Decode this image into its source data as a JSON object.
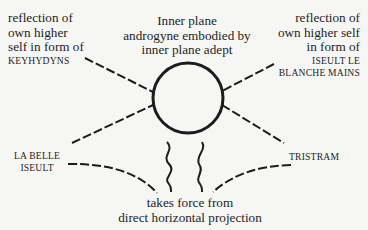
{
  "diagram": {
    "center_node": {
      "lines": [
        "Inner plane",
        "androgyne embodied by",
        "inner plane adept"
      ],
      "shape": "circle"
    },
    "top_left": {
      "lines": [
        "reflection of",
        "own higher",
        "self in form of"
      ],
      "name": "KEYHYDYNS"
    },
    "top_right": {
      "lines": [
        "reflection of",
        "own higher self",
        "in form of"
      ],
      "name_lines": [
        "ISEULT LE",
        "BLANCHE MAINS"
      ]
    },
    "bottom_left": {
      "name_lines": [
        "LA BELLE",
        "ISEULT"
      ]
    },
    "bottom_right": {
      "name": "TRISTRAM"
    },
    "bottom_center": {
      "lines": [
        "takes force from",
        "direct horizontal projection"
      ]
    },
    "connectors": [
      {
        "from": "top_left",
        "to": "center_node",
        "style": "dashed"
      },
      {
        "from": "bottom_left",
        "to": "center_node",
        "style": "dashed"
      },
      {
        "from": "top_right",
        "to": "center_node",
        "style": "dashed"
      },
      {
        "from": "bottom_right",
        "to": "center_node",
        "style": "dashed"
      },
      {
        "from": "bottom_left",
        "to": "bottom_center",
        "style": "dashed-curve"
      },
      {
        "from": "bottom_right",
        "to": "bottom_center",
        "style": "dashed-curve"
      },
      {
        "from": "bottom_center",
        "to": "center_node",
        "style": "wavy",
        "count": 2
      }
    ],
    "colors": {
      "background": "#f6f6f4",
      "ink": "#1c1c1c"
    }
  }
}
